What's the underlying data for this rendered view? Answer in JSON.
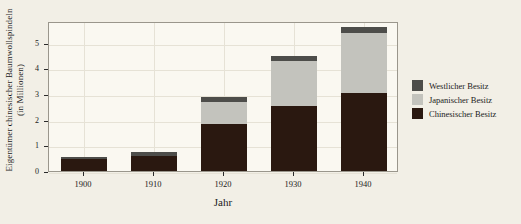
{
  "chart_data": {
    "type": "bar",
    "title": "",
    "subtitle": "",
    "stacked": true,
    "xlabel": "Jahr",
    "ylabel_line1": "Eigentümer chinesischer Baumwollspindeln",
    "ylabel_line2": "(in Millionen)",
    "categories": [
      "1900",
      "1910",
      "1920",
      "1930",
      "1940"
    ],
    "xlim": [
      1895,
      1945
    ],
    "ylim": [
      0,
      5.85
    ],
    "yticks": [
      "0",
      "1",
      "2",
      "3",
      "4",
      "5"
    ],
    "ytick_values": [
      0,
      1,
      2,
      3,
      4,
      5
    ],
    "xticks": [
      "1900",
      "1910",
      "1920",
      "1930",
      "1940"
    ],
    "grid": true,
    "legend_position": "right",
    "series": [
      {
        "name": "Chinesischer Besitz",
        "color": "#2a1810",
        "values": [
          0.45,
          0.6,
          1.85,
          2.55,
          3.05
        ]
      },
      {
        "name": "Japanischer Besitz",
        "color": "#c3c3bd",
        "values": [
          0.0,
          0.0,
          0.85,
          1.75,
          2.35
        ]
      },
      {
        "name": "Westlicher Besitz",
        "color": "#4d4d4a",
        "values": [
          0.1,
          0.15,
          0.2,
          0.2,
          0.2
        ]
      }
    ],
    "totals": [
      0.55,
      0.75,
      2.9,
      4.5,
      5.6
    ]
  },
  "legend": {
    "items": [
      {
        "label": "Westlicher Besitz",
        "color": "#4d4d4a"
      },
      {
        "label": "Japanischer Besitz",
        "color": "#c3c3bd"
      },
      {
        "label": "Chinesischer Besitz",
        "color": "#2a1810"
      }
    ]
  }
}
